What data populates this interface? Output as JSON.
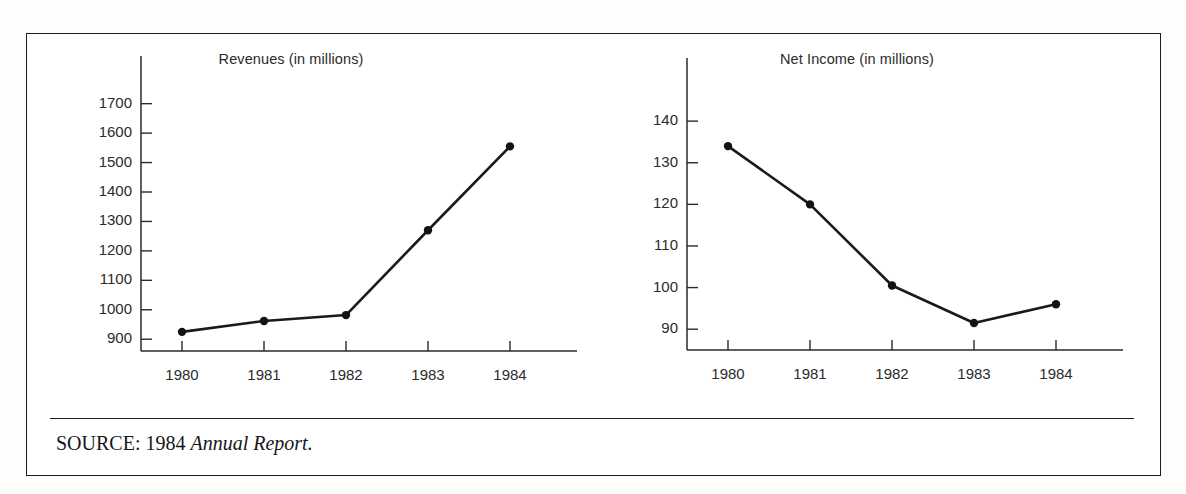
{
  "figure": {
    "source_prefix": "SOURCE: 1984",
    "source_italic": "Annual Report."
  },
  "chart_data": [
    {
      "type": "line",
      "title": "Revenues (in millions)",
      "xlabel": "",
      "ylabel": "",
      "categories": [
        "1980",
        "1981",
        "1982",
        "1983",
        "1984"
      ],
      "values": [
        925,
        962,
        982,
        1270,
        1555
      ],
      "yticks": [
        900,
        1000,
        1100,
        1200,
        1300,
        1400,
        1500,
        1600,
        1700
      ],
      "ylim": [
        860,
        1760
      ],
      "grid": false,
      "legend": "none",
      "markers": true
    },
    {
      "type": "line",
      "title": "Net Income (in millions)",
      "xlabel": "",
      "ylabel": "",
      "categories": [
        "1980",
        "1981",
        "1982",
        "1983",
        "1984"
      ],
      "values": [
        134,
        120,
        100.5,
        91.5,
        96
      ],
      "yticks": [
        90,
        100,
        110,
        120,
        130,
        140
      ],
      "ylim": [
        85,
        147
      ],
      "grid": false,
      "legend": "none",
      "markers": true
    }
  ]
}
